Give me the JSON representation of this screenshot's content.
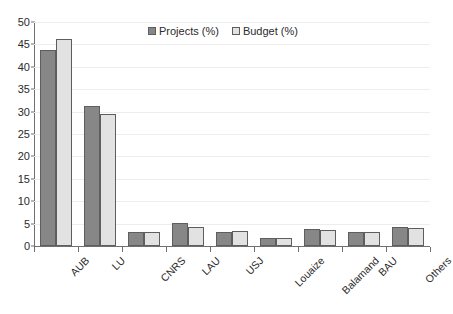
{
  "chart_data": {
    "type": "bar",
    "title": "",
    "subtitle": "",
    "xlabel": "",
    "ylabel": "",
    "ylim": [
      0,
      50
    ],
    "ytick_step": 5,
    "yticks": [
      0,
      5,
      10,
      15,
      20,
      25,
      30,
      35,
      40,
      45,
      50
    ],
    "grid": true,
    "legend_position": "top-center",
    "categories": [
      "AUB",
      "LU",
      "CNRS",
      "LAU",
      "USJ",
      "Louaize",
      "Balamand",
      "BAU",
      "Others"
    ],
    "series": [
      {
        "name": "Projects (%)",
        "color": "#878787",
        "values": [
          43.7,
          31.3,
          3.1,
          5.1,
          3.1,
          1.9,
          3.9,
          3.1,
          4.2
        ]
      },
      {
        "name": "Budget (%)",
        "color": "#e2e2e2",
        "values": [
          46.2,
          29.5,
          3.2,
          4.2,
          3.3,
          1.7,
          3.6,
          3.2,
          4.1
        ]
      }
    ]
  },
  "legend": {
    "items": [
      {
        "label": "Projects (%)",
        "swatch": "dark-gray-square"
      },
      {
        "label": "Budget (%)",
        "swatch": "light-gray-square"
      }
    ]
  },
  "axes": {
    "y": {
      "labels": [
        "50",
        "45",
        "40",
        "35",
        "30",
        "25",
        "20",
        "15",
        "10",
        "5",
        "0"
      ]
    },
    "x": {
      "labels": [
        "AUB",
        "LU",
        "CNRS",
        "LAU",
        "USJ",
        "Louaize",
        "Balamand",
        "BAU",
        "Others"
      ]
    }
  },
  "colors": {
    "series_projects": "#878787",
    "series_budget": "#e2e2e2",
    "axis": "#6f6f6f",
    "grid": "#ededed",
    "bar_border": "#5e5e5e",
    "text": "#2b2b2b",
    "background": "#ffffff"
  }
}
